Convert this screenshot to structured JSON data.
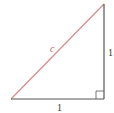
{
  "diagram": {
    "type": "right-triangle",
    "hypotenuse_label": "c",
    "vertical_leg_label": "1",
    "horizontal_leg_label": "1",
    "colors": {
      "hypotenuse": "#d98a8a",
      "legs": "#555555",
      "label_c": "#b85c5c",
      "labels": "#333333"
    },
    "right_angle_marker": true
  }
}
